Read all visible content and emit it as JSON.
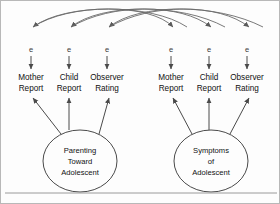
{
  "figure": {
    "type": "structural-equation-model-path-diagram",
    "background_color": "#fdfdfd",
    "border_color": "#b8b8b8",
    "line_color": "#4a4a4a",
    "curve_color": "#6a6a6a",
    "rule_color": "#9a9a9a",
    "width": 280,
    "height": 204
  },
  "error_terms": [
    {
      "id": "e1",
      "label": "e",
      "x": 30,
      "y": 48
    },
    {
      "id": "e2",
      "label": "e",
      "x": 68,
      "y": 48
    },
    {
      "id": "e3",
      "label": "e",
      "x": 106,
      "y": 48
    },
    {
      "id": "e4",
      "label": "e",
      "x": 170,
      "y": 48
    },
    {
      "id": "e5",
      "label": "e",
      "x": 208,
      "y": 48
    },
    {
      "id": "e6",
      "label": "e",
      "x": 246,
      "y": 48
    }
  ],
  "indicators": [
    {
      "id": "i1",
      "line1": "Mother",
      "line2": "Report",
      "x": 30,
      "y_line1": 76,
      "y_line2": 88,
      "factor": "parenting"
    },
    {
      "id": "i2",
      "line1": "Child",
      "line2": "Report",
      "x": 68,
      "y_line1": 76,
      "y_line2": 88,
      "factor": "parenting"
    },
    {
      "id": "i3",
      "line1": "Observer",
      "line2": "Rating",
      "x": 106,
      "y_line1": 76,
      "y_line2": 88,
      "factor": "parenting"
    },
    {
      "id": "i4",
      "line1": "Mother",
      "line2": "Report",
      "x": 170,
      "y_line1": 76,
      "y_line2": 88,
      "factor": "symptoms"
    },
    {
      "id": "i5",
      "line1": "Child",
      "line2": "Report",
      "x": 208,
      "y_line1": 76,
      "y_line2": 88,
      "factor": "symptoms"
    },
    {
      "id": "i6",
      "line1": "Observer",
      "line2": "Rating",
      "x": 246,
      "y_line1": 76,
      "y_line2": 88,
      "factor": "symptoms"
    }
  ],
  "latent_factors": [
    {
      "id": "parenting",
      "cx": 79,
      "cy": 160,
      "rx": 37,
      "ry": 31,
      "lines": [
        "Parenting",
        "Toward",
        "Adolescent"
      ]
    },
    {
      "id": "symptoms",
      "cx": 210,
      "cy": 160,
      "rx": 37,
      "ry": 31,
      "lines": [
        "Symptoms",
        "of",
        "Adolescent"
      ]
    }
  ],
  "loading_paths": [
    {
      "from": "parenting",
      "to": "i1"
    },
    {
      "from": "parenting",
      "to": "i2"
    },
    {
      "from": "parenting",
      "to": "i3"
    },
    {
      "from": "symptoms",
      "to": "i4"
    },
    {
      "from": "symptoms",
      "to": "i5"
    },
    {
      "from": "symptoms",
      "to": "i6"
    }
  ],
  "correlated_error_curves": [
    {
      "id": "c1",
      "d": "M 186 26 C 150 2, 64 2, 32 26",
      "target": "e1"
    },
    {
      "id": "c2",
      "d": "M 224 26 C 180 2, 100 2, 70 26",
      "target": "e2"
    },
    {
      "id": "c3",
      "d": "M 262 26 C 215 2, 138 2, 108 26",
      "target": "e3"
    },
    {
      "id": "c4",
      "d": "M 32 26  C 68 2, 150 2, 172 26",
      "target": "e4"
    },
    {
      "id": "c5",
      "d": "M 70 26  C 110 2, 180 2, 210 26",
      "target": "e5"
    },
    {
      "id": "c6",
      "d": "M 108 26 C 150 2, 218 2, 248 26",
      "target": "e6"
    }
  ],
  "footer_rule": {
    "y": 192
  }
}
